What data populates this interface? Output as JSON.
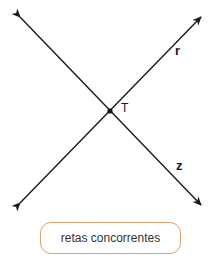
{
  "diagram": {
    "title": "retas concorrentes",
    "lines": [
      {
        "name": "r",
        "from": [
          20,
          203
        ],
        "to": [
          201,
          17
        ],
        "arrows": "both"
      },
      {
        "name": "z",
        "from": [
          20,
          17
        ],
        "to": [
          201,
          205
        ],
        "arrows": "both"
      }
    ],
    "intersection": {
      "label": "T",
      "point": [
        110,
        111
      ]
    },
    "labels": {
      "r": "r",
      "z": "z",
      "T": "T"
    },
    "caption": "retas concorrentes",
    "colors": {
      "line": "#1a1a1a",
      "caption_border": "#e0a070",
      "caption_text": "#333333"
    }
  }
}
